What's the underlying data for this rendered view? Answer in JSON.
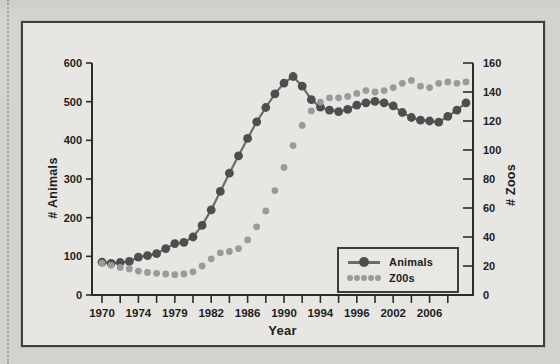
{
  "style": {
    "page_bg": "#d4d2cd",
    "margin_dot_color": "#979aa4",
    "frame_bg": "#e7e6e2",
    "frame_border": "#3e3e3e",
    "axis_color": "#2b2b2b",
    "text_color": "#1d1d1d",
    "animals_dot_color": "#4e4e4e",
    "animals_line_color": "#6b6b6b",
    "zoos_dot_color": "#9a9a9a"
  },
  "chart_data": {
    "type": "line",
    "title": "",
    "x_axis_label": "Year",
    "left_axis": {
      "label": "# Animals",
      "min": 0,
      "max": 600,
      "ticks": [
        0,
        100,
        200,
        300,
        400,
        500,
        600
      ]
    },
    "right_axis": {
      "label": "# Zoos",
      "min": 0,
      "max": 160,
      "ticks": [
        0,
        20,
        40,
        60,
        80,
        100,
        120,
        140,
        160
      ]
    },
    "x_tick_labels": [
      "1970",
      "",
      "1974",
      "",
      "1979",
      "",
      "1982",
      "",
      "1986",
      "",
      "1990",
      "",
      "1994",
      "",
      "1996",
      "",
      "2002",
      "",
      "2006",
      ""
    ],
    "x": [
      1970,
      1971,
      1972,
      1973,
      1974,
      1975,
      1976,
      1977,
      1978,
      1979,
      1980,
      1981,
      1982,
      1983,
      1984,
      1985,
      1986,
      1987,
      1988,
      1989,
      1990,
      1991,
      1992,
      1993,
      1994,
      1995,
      1996,
      1997,
      1998,
      1999,
      2000,
      2001,
      2002,
      2003,
      2004,
      2005,
      2006,
      2007,
      2008,
      2009,
      2010
    ],
    "series": [
      {
        "name": "Animals",
        "axis": "left",
        "line": true,
        "color": "#4e4e4e",
        "line_color": "#6b6b6b",
        "values": [
          85,
          82,
          84,
          87,
          98,
          102,
          107,
          120,
          133,
          136,
          150,
          180,
          220,
          268,
          315,
          360,
          405,
          448,
          485,
          520,
          548,
          565,
          540,
          505,
          486,
          478,
          474,
          480,
          491,
          497,
          501,
          497,
          489,
          472,
          459,
          452,
          450,
          447,
          462,
          478,
          497
        ]
      },
      {
        "name": "Z00s",
        "axis": "right",
        "line": false,
        "color": "#9a9a9a",
        "line_color": "#9a9a9a",
        "values": [
          22,
          20.5,
          19,
          18,
          16.5,
          15.5,
          15,
          14.5,
          14,
          14.5,
          16,
          20,
          25,
          29,
          30,
          32,
          38,
          47,
          58,
          72,
          88,
          103,
          117,
          127,
          133,
          136,
          136,
          137,
          139,
          141,
          140,
          141,
          143,
          146,
          148,
          144,
          143,
          146,
          147,
          146,
          147
        ]
      }
    ],
    "legend_position": "bottom-right-inside",
    "grid": false
  }
}
